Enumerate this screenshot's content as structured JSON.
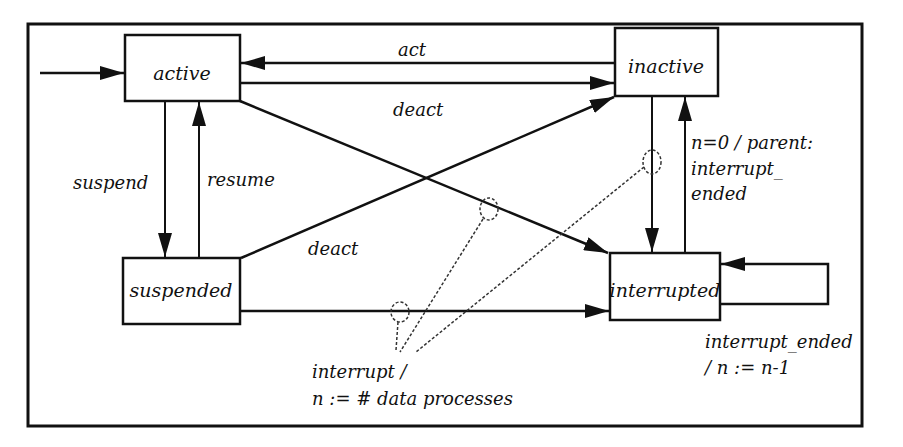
{
  "diagram": {
    "type": "state-machine",
    "states": [
      {
        "id": "active",
        "label": "active"
      },
      {
        "id": "inactive",
        "label": "inactive"
      },
      {
        "id": "suspended",
        "label": "suspended"
      },
      {
        "id": "interrupted",
        "label": "interrupted"
      }
    ],
    "transitions": [
      {
        "from": "start",
        "to": "active",
        "label": ""
      },
      {
        "from": "inactive",
        "to": "active",
        "label": "act"
      },
      {
        "from": "active",
        "to": "inactive",
        "label": "deact"
      },
      {
        "from": "active",
        "to": "suspended",
        "label": "suspend"
      },
      {
        "from": "suspended",
        "to": "active",
        "label": "resume"
      },
      {
        "from": "suspended",
        "to": "inactive",
        "label": "deact"
      },
      {
        "from": "active",
        "to": "interrupted",
        "label": ""
      },
      {
        "from": "suspended",
        "to": "interrupted",
        "label": ""
      },
      {
        "from": "inactive",
        "to": "interrupted",
        "label": ""
      },
      {
        "from": "interrupted",
        "to": "inactive",
        "label": "n=0 / parent: interrupt_ ended"
      },
      {
        "from": "interrupted",
        "to": "interrupted",
        "label": "interrupt_ended / n := n-1"
      }
    ],
    "labels": {
      "act": "act",
      "deact_top": "deact",
      "deact_mid": "deact",
      "suspend": "suspend",
      "resume": "resume",
      "parent_line1": "n=0 / parent:",
      "parent_line2": "interrupt_",
      "parent_line3": "ended",
      "self_line1": "interrupt_ended",
      "self_line2": "/ n := n-1",
      "interrupt_line1": "interrupt /",
      "interrupt_line2": "n := # data processes"
    },
    "colors": {
      "stroke": "#111111",
      "background": "#ffffff"
    }
  }
}
